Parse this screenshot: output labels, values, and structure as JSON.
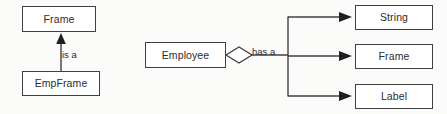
{
  "diagram": {
    "type": "uml-relationship-diagram",
    "background_color": "#fbfbfa",
    "line_color": "#404044",
    "text_color": "#2b2b30",
    "box_fill": "#ffffff",
    "nodes": {
      "frame_super": {
        "label": "Frame"
      },
      "empframe": {
        "label": "EmpFrame"
      },
      "employee": {
        "label": "Employee"
      },
      "string_attr": {
        "label": "String"
      },
      "frame_attr": {
        "label": "Frame"
      },
      "label_attr": {
        "label": "Label"
      }
    },
    "edges": {
      "inheritance": {
        "label": "is a",
        "from": "EmpFrame",
        "to": "Frame",
        "arrow": "solid-triangle-up"
      },
      "aggregation": {
        "label": "has a",
        "from": "Employee",
        "to": [
          "String",
          "Frame",
          "Label"
        ],
        "source_marker": "open-diamond",
        "arrow": "solid-triangle-right"
      }
    }
  }
}
